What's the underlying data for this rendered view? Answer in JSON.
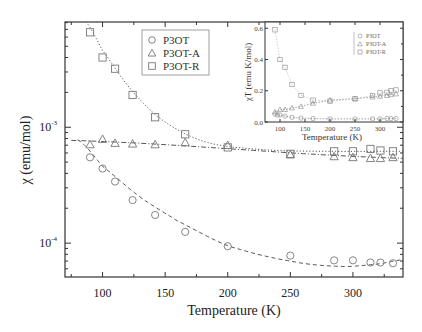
{
  "chart_data": [
    {
      "name": "main",
      "type": "scatter",
      "xlabel": "Temperature  (K)",
      "ylabel": "χ (emu/mol)",
      "yscale": "log",
      "xlim": [
        70,
        340
      ],
      "ylim": [
        5.1e-05,
        0.0081
      ],
      "xticks": [
        100,
        150,
        200,
        250,
        300
      ],
      "xtick_labels": [
        "100",
        "150",
        "200",
        "250",
        "300"
      ],
      "yticks": [
        0.0001,
        0.001
      ],
      "ytick_labels": [
        {
          "base": "10",
          "exp": "-4"
        },
        {
          "base": "10",
          "exp": "-3"
        }
      ],
      "legend": {
        "position": "top-center",
        "entries": [
          {
            "label": "P3OT",
            "marker": "circle"
          },
          {
            "label": "P3OT-A",
            "marker": "triangle"
          },
          {
            "label": "P3OT-R",
            "marker": "square"
          }
        ]
      },
      "series": [
        {
          "name": "P3OT",
          "marker": "circle",
          "fit_style": "dashed",
          "x": [
            90,
            100,
            110,
            124,
            142,
            166,
            200,
            250,
            285,
            300,
            314,
            322,
            332
          ],
          "y": [
            0.00055,
            0.00044,
            0.00034,
            0.000235,
            0.000175,
            0.000125,
            9.4e-05,
            7.8e-05,
            7.1e-05,
            7.1e-05,
            6.8e-05,
            6.8e-05,
            6.7e-05
          ],
          "fit": {
            "x": [
              80,
              100,
              130,
              160,
              200,
              250,
              290,
              320,
              340
            ],
            "y": [
              0.00078,
              0.00046,
              0.00025,
              0.000155,
              9.5e-05,
              7e-05,
              6.3e-05,
              6.6e-05,
              7.2e-05
            ]
          }
        },
        {
          "name": "P3OT-A",
          "marker": "triangle",
          "fit_style": "dash-dot",
          "x": [
            90,
            100,
            110,
            124,
            142,
            166,
            200,
            250,
            285,
            300,
            314,
            322,
            332
          ],
          "y": [
            0.00071,
            0.00079,
            0.00073,
            0.00072,
            0.00071,
            0.00074,
            0.0007,
            0.00058,
            0.00056,
            0.00055,
            0.00054,
            0.00054,
            0.00055
          ],
          "fit": {
            "x": [
              75,
              340
            ],
            "y": [
              0.00077,
              0.00054
            ]
          }
        },
        {
          "name": "P3OT-R",
          "marker": "square",
          "fit_style": "dotted",
          "x": [
            90,
            100,
            110,
            124,
            142,
            166,
            200,
            250,
            285,
            300,
            314,
            322,
            332
          ],
          "y": [
            0.0066,
            0.004,
            0.0032,
            0.0019,
            0.00122,
            0.00087,
            0.00067,
            0.00059,
            0.00062,
            0.00062,
            0.00065,
            0.00063,
            0.00062
          ],
          "fit": {
            "x": [
              85,
              100,
              120,
              140,
              160,
              180,
              200,
              240,
              280,
              340
            ],
            "y": [
              0.0085,
              0.0046,
              0.0023,
              0.00135,
              0.00095,
              0.00076,
              0.00068,
              0.00063,
              0.00062,
              0.00062
            ]
          }
        }
      ]
    },
    {
      "name": "inset",
      "type": "scatter",
      "xlabel": "Temperature  (K)",
      "ylabel": "χT (emu K/mol)",
      "xlim": [
        70,
        346
      ],
      "ylim": [
        0.0,
        0.64
      ],
      "xticks": [
        100,
        150,
        200,
        250,
        300
      ],
      "xtick_labels": [
        "100",
        "150",
        "200",
        "250",
        "300"
      ],
      "yticks": [
        0.0,
        0.2,
        0.4,
        0.6
      ],
      "ytick_labels": [
        "0.0",
        "0.2",
        "0.4",
        "0.6"
      ],
      "legend": {
        "position": "top-right",
        "entries": [
          {
            "label": "P3OT",
            "marker": "circle"
          },
          {
            "label": "P3OT-A",
            "marker": "triangle"
          },
          {
            "label": "P3OT-R",
            "marker": "square"
          }
        ]
      },
      "series": [
        {
          "name": "P3OT",
          "marker": "circle",
          "x": [
            90,
            95,
            100,
            110,
            124,
            142,
            166,
            200,
            250,
            285,
            300,
            314,
            322,
            332
          ],
          "y": [
            0.05,
            0.045,
            0.045,
            0.038,
            0.03,
            0.025,
            0.022,
            0.02,
            0.02,
            0.02,
            0.02,
            0.022,
            0.022,
            0.022
          ]
        },
        {
          "name": "P3OT-A",
          "marker": "triangle",
          "x": [
            90,
            100,
            110,
            124,
            142,
            166,
            200,
            250,
            285,
            300,
            314,
            322,
            332
          ],
          "y": [
            0.065,
            0.08,
            0.08,
            0.09,
            0.1,
            0.12,
            0.14,
            0.15,
            0.16,
            0.165,
            0.17,
            0.175,
            0.18
          ]
        },
        {
          "name": "P3OT-R",
          "marker": "square",
          "x": [
            90,
            100,
            110,
            124,
            142,
            166,
            200,
            250,
            285,
            300,
            314,
            322,
            332
          ],
          "y": [
            0.59,
            0.4,
            0.35,
            0.24,
            0.17,
            0.14,
            0.134,
            0.148,
            0.17,
            0.186,
            0.19,
            0.2,
            0.205
          ]
        }
      ]
    }
  ]
}
